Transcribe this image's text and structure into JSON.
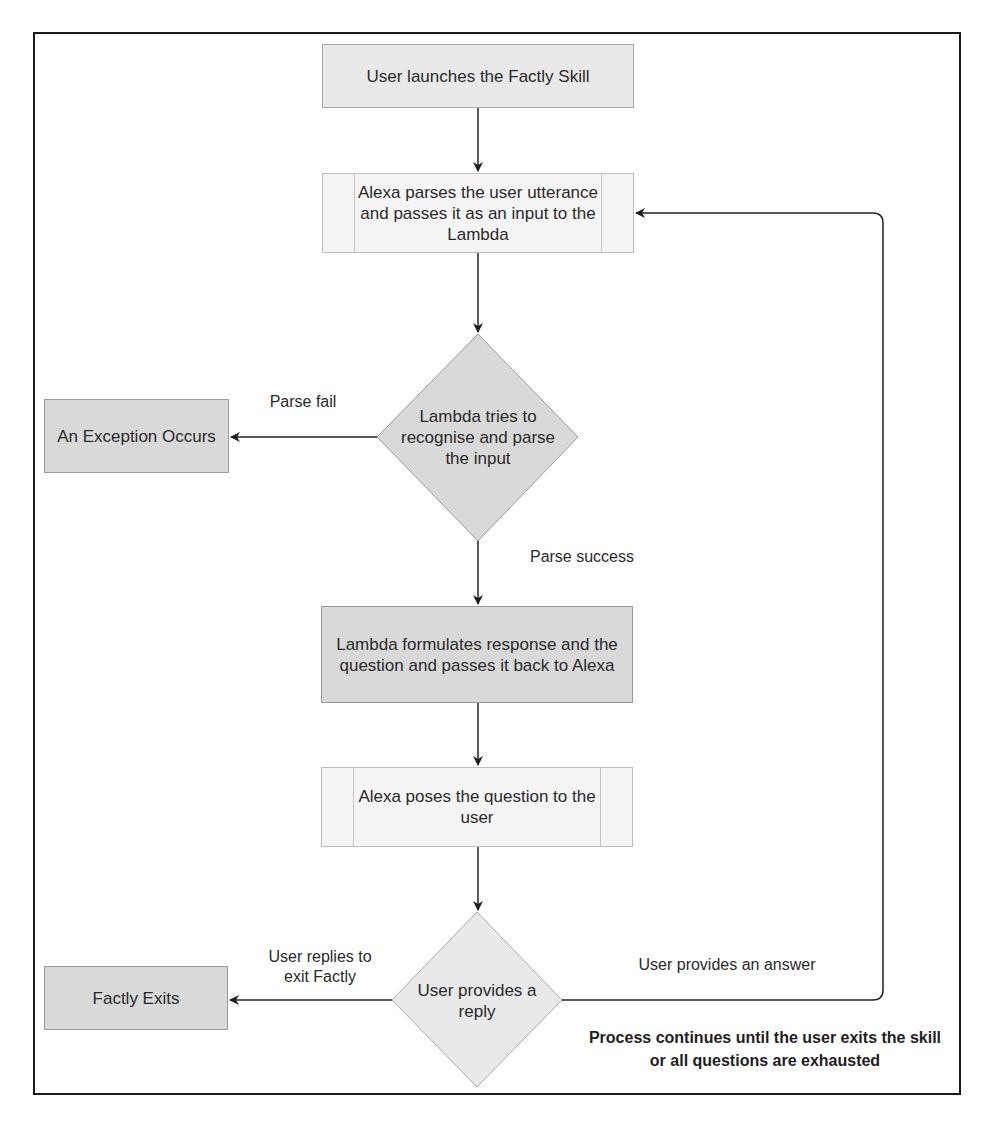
{
  "diagram": {
    "type": "flowchart",
    "nodes": {
      "start": {
        "label": "User launches the Factly Skill",
        "shape": "rectangle"
      },
      "alexa_parse": {
        "label": "Alexa parses the user utterance and passes it as an input to the Lambda",
        "shape": "process"
      },
      "lambda_decision": {
        "label": "Lambda tries to recognise and parse the input",
        "shape": "diamond"
      },
      "exception": {
        "label": "An Exception Occurs",
        "shape": "rectangle"
      },
      "lambda_response": {
        "label": "Lambda formulates response and the question and passes it back to Alexa",
        "shape": "rectangle"
      },
      "alexa_pose": {
        "label": "Alexa poses the question to the user",
        "shape": "process"
      },
      "user_decision": {
        "label": "User provides a reply",
        "shape": "diamond"
      },
      "exit": {
        "label": "Factly Exits",
        "shape": "rectangle"
      }
    },
    "edges": {
      "parse_fail": "Parse fail",
      "parse_success": "Parse success",
      "user_exit": "User replies to exit Factly",
      "user_answer": "User provides an answer"
    },
    "note": "Process continues until the user exits the skill or all questions are exhausted",
    "colors": {
      "frame": "#1a1a1a",
      "line": "#222222",
      "light_fill": "#f4f4f4",
      "mid_fill": "#e9e9e9",
      "dark_fill": "#d9d9d9"
    }
  }
}
